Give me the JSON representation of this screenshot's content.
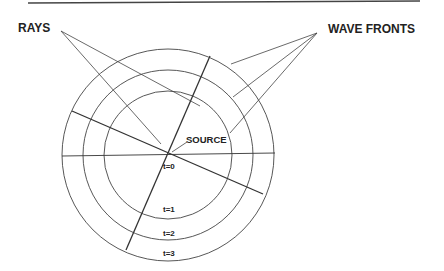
{
  "labels": {
    "rays": "RAYS",
    "wave_fronts": "WAVE FRONTS",
    "source": "SOURCE",
    "t0": "t=0",
    "t1": "t=1",
    "t2": "t=2",
    "t3": "t=3"
  },
  "colors": {
    "line": "#333333",
    "text": "#222222",
    "background": "#ffffff"
  }
}
